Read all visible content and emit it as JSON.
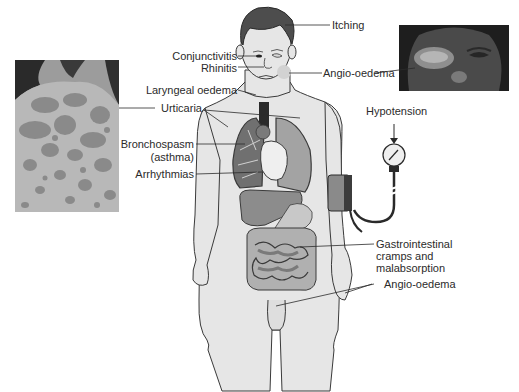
{
  "figure": {
    "labels": {
      "itching": "Itching",
      "conjunctivitis": "Conjunctivitis",
      "rhinitis": "Rhinitis",
      "angio_oedema_face": "Angio-oedema",
      "laryngeal_oedema": "Laryngeal oedema",
      "urticaria": "Urticaria",
      "hypotension": "Hypotension",
      "bronchospasm_line1": "Bronchospasm",
      "bronchospasm_line2": "(asthma)",
      "arrhythmias": "Arrhythmias",
      "gi_line1": "Gastrointestinal",
      "gi_line2": "cramps and",
      "gi_line3": "malabsorption",
      "angio_oedema_body": "Angio-oedema"
    },
    "photos": {
      "urticaria_back": "urticaria-on-back-photo",
      "angio_oedema_eye": "angio-oedema-eye-photo"
    },
    "colors": {
      "background": "#ffffff",
      "skin": "#e6e6e6",
      "outline": "#3a3a3a",
      "organ_dark": "#8a8a8a",
      "organ_mid": "#a8a8a8",
      "organ_light": "#f0f0f0",
      "text": "#2b2b2b"
    }
  }
}
